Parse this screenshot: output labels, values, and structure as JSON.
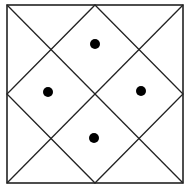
{
  "diagram": {
    "colors": {
      "stroke": "#222222",
      "dot": "#000000",
      "background": "#ffffff"
    },
    "square": {
      "x1": 7,
      "y1": 5,
      "x2": 183,
      "y2": 183
    },
    "dots": [
      {
        "name": "top",
        "cx": 95,
        "cy": 44,
        "r": 5
      },
      {
        "name": "left",
        "cx": 48,
        "cy": 92,
        "r": 5
      },
      {
        "name": "right",
        "cx": 141,
        "cy": 91,
        "r": 5
      },
      {
        "name": "bottom",
        "cx": 94,
        "cy": 138,
        "r": 5
      }
    ]
  }
}
